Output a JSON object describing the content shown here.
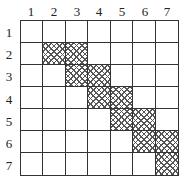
{
  "columns": [
    "1",
    "2",
    "3",
    "4",
    "5",
    "6",
    "7"
  ],
  "rows": [
    "1",
    "2",
    "3",
    "4",
    "5",
    "6",
    "7"
  ],
  "hatch_pattern": "crosshatch",
  "hatched_cells": [
    [
      2,
      2
    ],
    [
      2,
      3
    ],
    [
      3,
      3
    ],
    [
      3,
      4
    ],
    [
      4,
      4
    ],
    [
      4,
      5
    ],
    [
      5,
      5
    ],
    [
      5,
      6
    ],
    [
      6,
      6
    ],
    [
      6,
      7
    ],
    [
      7,
      7
    ]
  ],
  "matrix": [
    [
      0,
      0,
      0,
      0,
      0,
      0,
      0
    ],
    [
      0,
      1,
      1,
      0,
      0,
      0,
      0
    ],
    [
      0,
      0,
      1,
      1,
      0,
      0,
      0
    ],
    [
      0,
      0,
      0,
      1,
      1,
      0,
      0
    ],
    [
      0,
      0,
      0,
      0,
      1,
      1,
      0
    ],
    [
      0,
      0,
      0,
      0,
      0,
      1,
      1
    ],
    [
      0,
      0,
      0,
      0,
      0,
      0,
      1
    ]
  ]
}
